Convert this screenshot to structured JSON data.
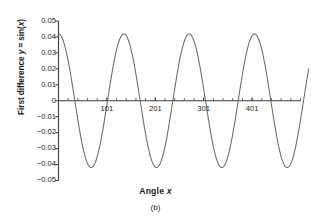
{
  "figure": {
    "caption": "(b)",
    "background": "#ffffff"
  },
  "chart_data": {
    "type": "line",
    "title": "",
    "subtitle": "",
    "xlabel_text": "Angle x",
    "xlabel_plain": "Angle",
    "xlabel_italic": "x",
    "ylabel_text": "First difference y = sin(x)",
    "ylabel_part1": "First difference ",
    "ylabel_var_y": "y",
    "ylabel_mid": " = sin(",
    "ylabel_var_x": "x",
    "ylabel_end": ")",
    "line_color": "#6b6b6b",
    "axis_color": "#3d3d3d",
    "grid": false,
    "legend": false,
    "xlim": [
      1,
      501
    ],
    "ylim": [
      -0.05,
      0.05
    ],
    "xticks": [
      101,
      201,
      301,
      401
    ],
    "xtick_labels": [
      "101",
      "201",
      "301",
      "401"
    ],
    "xtick_minor_step": 20,
    "yticks": [
      0.05,
      0.04,
      0.03,
      0.02,
      0.01,
      0,
      -0.01,
      -0.02,
      -0.03,
      -0.04,
      -0.05
    ],
    "ytick_labels": [
      "0.05",
      "0.04",
      "0.03",
      "0.02",
      "0.01",
      "0",
      "−0.01",
      "−0.02",
      "−0.03",
      "−0.04",
      "−0.05"
    ],
    "series": [
      {
        "name": "First difference y = sin(x)",
        "amplitude": 0.0419,
        "period_x": 135,
        "phase_deg": 90,
        "x_start": 1,
        "x_end": 518,
        "description": "Damped-free sinusoid: y = 0.0419 * cos(2*pi*(x-1)/135), sampled every 1 unit",
        "x": [
          1,
          35,
          69,
          102,
          136,
          169,
          203,
          237,
          270,
          304,
          338,
          371,
          405,
          439,
          472,
          506,
          518
        ],
        "values": [
          0.0419,
          0.0,
          -0.0419,
          0.0,
          0.0419,
          0.0,
          -0.0419,
          0.0,
          0.0419,
          0.0,
          -0.0419,
          0.0,
          0.0419,
          0.0,
          -0.0419,
          0.0,
          -0.019
        ]
      }
    ],
    "peaks": [
      {
        "x": 1,
        "y": 0.0419
      },
      {
        "x": 136,
        "y": 0.0419
      },
      {
        "x": 270,
        "y": 0.0419
      },
      {
        "x": 405,
        "y": 0.0419
      }
    ],
    "troughs": [
      {
        "x": 69,
        "y": -0.0419
      },
      {
        "x": 203,
        "y": -0.0419
      },
      {
        "x": 338,
        "y": -0.0419
      },
      {
        "x": 472,
        "y": -0.0419
      }
    ]
  }
}
